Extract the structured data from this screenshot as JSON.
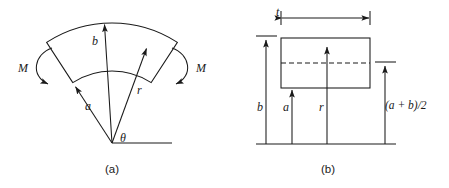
{
  "figure": {
    "stroke_color": "#1a1a1a",
    "background_color": "#ffffff"
  },
  "panel_a": {
    "caption": "(a)",
    "labels": {
      "moment_left": "M",
      "moment_right": "M",
      "inner_radius": "a",
      "centroid_radius": "r",
      "outer_radius": "b",
      "angle": "θ"
    },
    "geometry": {
      "apex_x": 112,
      "apex_y": 143,
      "inner_radius_px": 72,
      "outer_radius_px": 120,
      "half_angle_deg": 33,
      "reference_line_end_x": 172
    },
    "icons": {
      "moment_left": "curved-arrow-counterclockwise-icon",
      "moment_right": "curved-arrow-clockwise-icon",
      "inner_radius_arrow": "arrow-up-icon",
      "centroid_radius_arrow": "arrow-up-icon",
      "outer_radius_arrow": "arrow-up-icon"
    }
  },
  "panel_b": {
    "caption": "(b)",
    "labels": {
      "thickness": "t",
      "outer_radius": "b",
      "inner_radius": "a",
      "centroid_radius": "r",
      "mid_radius": "(a + b)/2"
    },
    "geometry": {
      "baseline_y": 144,
      "baseline_x_start": 256,
      "baseline_x_end": 396,
      "rect_left": 281,
      "rect_right": 370,
      "rect_top": 38,
      "rect_bottom": 88,
      "dashed_center_y": 63,
      "thickness_dim_y": 18,
      "arrow_b_x": 266,
      "arrow_a_x": 292,
      "arrow_r_x": 327,
      "arrow_mid_x": 385
    },
    "icons": {
      "thickness_dimension": "double-headed-arrow-icon",
      "arrow_b": "arrow-up-icon",
      "arrow_a": "arrow-up-icon",
      "arrow_r": "arrow-up-icon",
      "arrow_mid": "arrow-up-icon",
      "centerline": "dashed-line-icon"
    }
  }
}
